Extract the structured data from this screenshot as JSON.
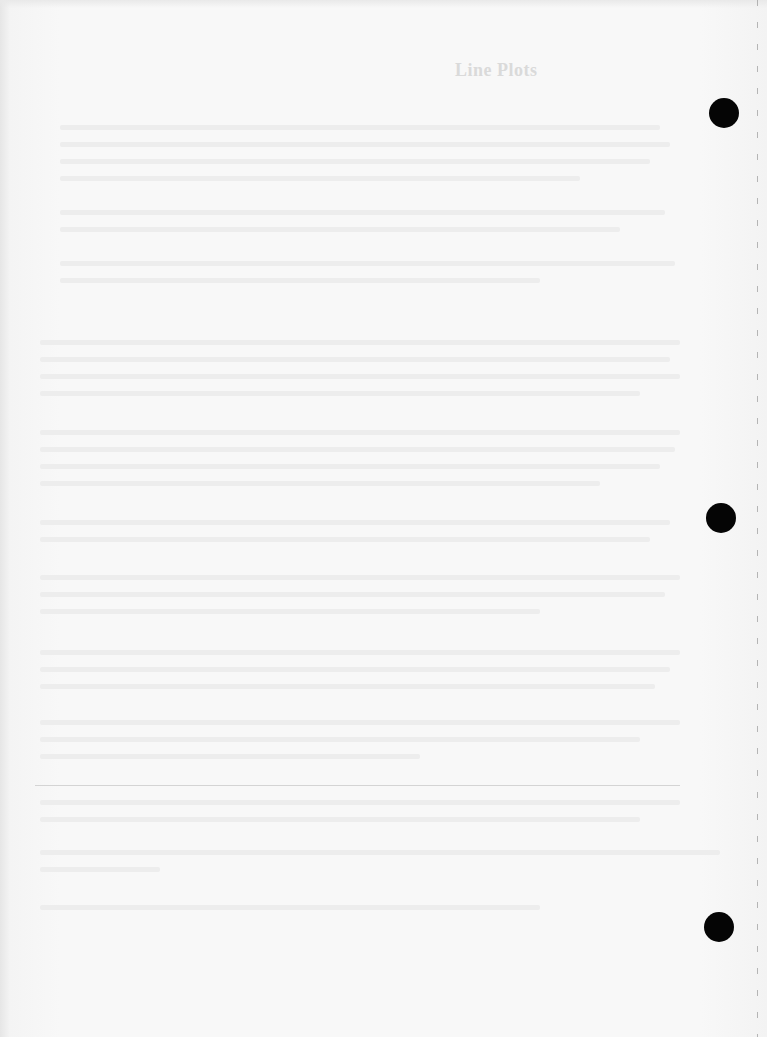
{
  "document": {
    "heading": "Line Plots",
    "body_legible": false
  },
  "binder_holes": [
    {
      "cx": 724,
      "cy": 113
    },
    {
      "cx": 721,
      "cy": 518
    },
    {
      "cx": 719,
      "cy": 927
    }
  ],
  "colors": {
    "paper": "#f7f7f7",
    "ghost_text": "#ededed",
    "hole": "#050505",
    "rule": "#d4d4d4"
  }
}
